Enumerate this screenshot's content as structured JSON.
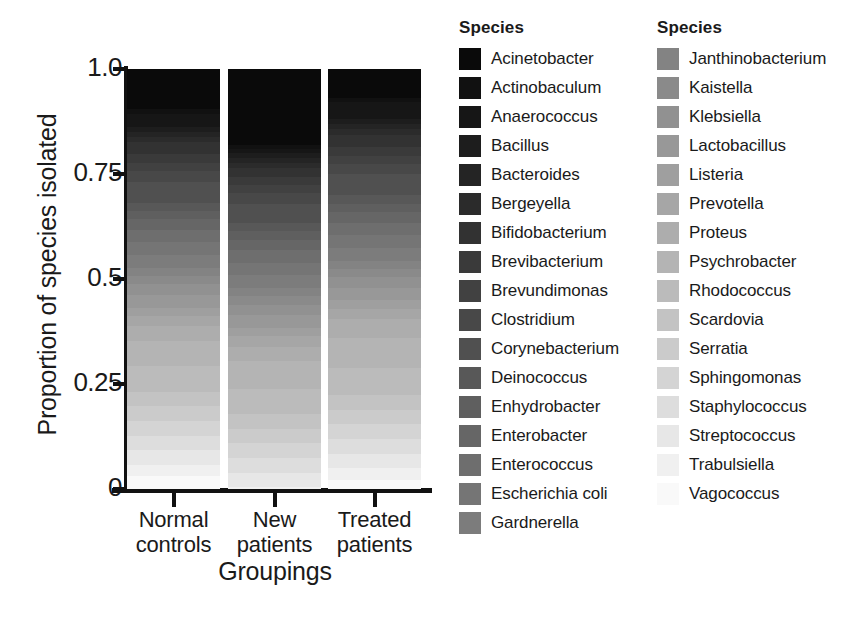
{
  "chart_data": {
    "type": "bar",
    "subtype": "stacked-proportional",
    "title": "",
    "xlabel": "Groupings",
    "ylabel": "Proportion of species isolated",
    "ylim": [
      0,
      1
    ],
    "ytick_labels": [
      "0",
      "0.25",
      "0.5",
      "0.75",
      "1.0"
    ],
    "ytick_values": [
      0,
      0.25,
      0.5,
      0.75,
      1.0
    ],
    "grid": false,
    "legend_position": "right",
    "legend_titles": [
      "Species",
      "Species"
    ],
    "categories": [
      "Normal controls",
      "New patients",
      "Treated patients"
    ],
    "category_lines": [
      [
        "Normal",
        "controls"
      ],
      [
        "New",
        "patients"
      ],
      [
        "Treated",
        "patients"
      ]
    ],
    "stack_order_bottom_to_top": "Vagococcus at bottom (lightest) to Acinetobacter at top (darkest)",
    "series": [
      {
        "name": "Acinetobacter",
        "color": "#0a0a0a",
        "values": [
          0.095,
          0.18,
          0.068
        ]
      },
      {
        "name": "Actinobaculum",
        "color": "#111111",
        "values": [
          0.012,
          0.01,
          0.01
        ]
      },
      {
        "name": "Anaerococcus",
        "color": "#161616",
        "values": [
          0.03,
          0.01,
          0.042
        ]
      },
      {
        "name": "Bacillus",
        "color": "#1d1d1d",
        "values": [
          0.012,
          0.012,
          0.012
        ]
      },
      {
        "name": "Bacteroides",
        "color": "#242424",
        "values": [
          0.012,
          0.012,
          0.012
        ]
      },
      {
        "name": "Bergeyella",
        "color": "#2b2b2b",
        "values": [
          0.012,
          0.012,
          0.012
        ]
      },
      {
        "name": "Bifidobacterium",
        "color": "#323232",
        "values": [
          0.03,
          0.02,
          0.03
        ]
      },
      {
        "name": "Brevibacterium",
        "color": "#3a3a3a",
        "values": [
          0.02,
          0.02,
          0.02
        ]
      },
      {
        "name": "Brevundimonas",
        "color": "#414141",
        "values": [
          0.02,
          0.02,
          0.02
        ]
      },
      {
        "name": "Clostridium",
        "color": "#484848",
        "values": [
          0.025,
          0.025,
          0.025
        ]
      },
      {
        "name": "Corynebacterium",
        "color": "#505050",
        "values": [
          0.05,
          0.045,
          0.05
        ]
      },
      {
        "name": "Deinococcus",
        "color": "#585858",
        "values": [
          0.02,
          0.02,
          0.02
        ]
      },
      {
        "name": "Enhydrobacter",
        "color": "#5f5f5f",
        "values": [
          0.02,
          0.02,
          0.02
        ]
      },
      {
        "name": "Enterobacter",
        "color": "#666666",
        "values": [
          0.025,
          0.025,
          0.025
        ]
      },
      {
        "name": "Enterococcus",
        "color": "#6e6e6e",
        "values": [
          0.03,
          0.03,
          0.03
        ]
      },
      {
        "name": "Escherichia coli",
        "color": "#757575",
        "values": [
          0.03,
          0.03,
          0.03
        ]
      },
      {
        "name": "Gardnerella",
        "color": "#7c7c7c",
        "values": [
          0.03,
          0.03,
          0.03
        ]
      },
      {
        "name": "Janthinobacterium",
        "color": "#838383",
        "values": [
          0.02,
          0.02,
          0.02
        ]
      },
      {
        "name": "Kaistella",
        "color": "#8a8a8a",
        "values": [
          0.02,
          0.02,
          0.02
        ]
      },
      {
        "name": "Klebsiella",
        "color": "#919191",
        "values": [
          0.025,
          0.025,
          0.025
        ]
      },
      {
        "name": "Lactobacillus",
        "color": "#989898",
        "values": [
          0.03,
          0.03,
          0.03
        ]
      },
      {
        "name": "Listeria",
        "color": "#9f9f9f",
        "values": [
          0.02,
          0.02,
          0.02
        ]
      },
      {
        "name": "Prevotella",
        "color": "#a6a6a6",
        "values": [
          0.025,
          0.025,
          0.025
        ]
      },
      {
        "name": "Proteus",
        "color": "#adadad",
        "values": [
          0.035,
          0.035,
          0.045
        ]
      },
      {
        "name": "Psychrobacter",
        "color": "#b4b4b4",
        "values": [
          0.06,
          0.065,
          0.07
        ]
      },
      {
        "name": "Rhodococcus",
        "color": "#bbbbbb",
        "values": [
          0.06,
          0.06,
          0.065
        ]
      },
      {
        "name": "Scardovia",
        "color": "#c3c3c3",
        "values": [
          0.035,
          0.035,
          0.035
        ]
      },
      {
        "name": "Serratia",
        "color": "#cbcbcb",
        "values": [
          0.035,
          0.035,
          0.035
        ]
      },
      {
        "name": "Sphingomonas",
        "color": "#d4d4d4",
        "values": [
          0.035,
          0.035,
          0.035
        ]
      },
      {
        "name": "Staphylococcus",
        "color": "#dddddd",
        "values": [
          0.035,
          0.035,
          0.035
        ]
      },
      {
        "name": "Streptococcus",
        "color": "#e7e7e7",
        "values": [
          0.035,
          0.035,
          0.035
        ]
      },
      {
        "name": "Trabulsiella",
        "color": "#f0f0f0",
        "values": [
          0.026,
          0.029,
          0.027
        ]
      },
      {
        "name": "Vagococcus",
        "color": "#f9f9f9",
        "values": [
          0.026,
          0.025,
          0.025
        ]
      }
    ]
  },
  "axis": {
    "ylabel": "Proportion of species isolated",
    "xlabel": "Groupings",
    "yticks": [
      "1.0",
      "0.75",
      "0.5",
      "0.25",
      "0"
    ]
  },
  "legend": {
    "col1": {
      "title": "Species",
      "items": [
        {
          "label": "Acinetobacter",
          "color": "#0a0a0a"
        },
        {
          "label": "Actinobaculum",
          "color": "#111111"
        },
        {
          "label": "Anaerococcus",
          "color": "#161616"
        },
        {
          "label": "Bacillus",
          "color": "#1d1d1d"
        },
        {
          "label": "Bacteroides",
          "color": "#242424"
        },
        {
          "label": "Bergeyella",
          "color": "#2b2b2b"
        },
        {
          "label": "Bifidobacterium",
          "color": "#323232"
        },
        {
          "label": "Brevibacterium",
          "color": "#3a3a3a"
        },
        {
          "label": "Brevundimonas",
          "color": "#414141"
        },
        {
          "label": "Clostridium",
          "color": "#484848"
        },
        {
          "label": "Corynebacterium",
          "color": "#505050"
        },
        {
          "label": "Deinococcus",
          "color": "#585858"
        },
        {
          "label": "Enhydrobacter",
          "color": "#5f5f5f"
        },
        {
          "label": "Enterobacter",
          "color": "#666666"
        },
        {
          "label": "Enterococcus",
          "color": "#6e6e6e"
        },
        {
          "label": "Escherichia coli",
          "color": "#757575"
        },
        {
          "label": "Gardnerella",
          "color": "#7c7c7c"
        }
      ]
    },
    "col2": {
      "title": "Species",
      "items": [
        {
          "label": "Janthinobacterium",
          "color": "#838383"
        },
        {
          "label": "Kaistella",
          "color": "#8a8a8a"
        },
        {
          "label": "Klebsiella",
          "color": "#919191"
        },
        {
          "label": "Lactobacillus",
          "color": "#989898"
        },
        {
          "label": "Listeria",
          "color": "#9f9f9f"
        },
        {
          "label": "Prevotella",
          "color": "#a6a6a6"
        },
        {
          "label": "Proteus",
          "color": "#adadad"
        },
        {
          "label": "Psychrobacter",
          "color": "#b4b4b4"
        },
        {
          "label": "Rhodococcus",
          "color": "#bbbbbb"
        },
        {
          "label": "Scardovia",
          "color": "#c3c3c3"
        },
        {
          "label": "Serratia",
          "color": "#cbcbcb"
        },
        {
          "label": "Sphingomonas",
          "color": "#d4d4d4"
        },
        {
          "label": "Staphylococcus",
          "color": "#dddddd"
        },
        {
          "label": "Streptococcus",
          "color": "#e7e7e7"
        },
        {
          "label": "Trabulsiella",
          "color": "#f0f0f0"
        },
        {
          "label": "Vagococcus",
          "color": "#f9f9f9"
        }
      ]
    }
  }
}
